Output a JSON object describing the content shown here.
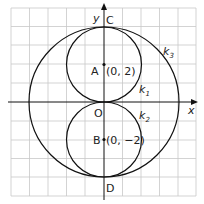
{
  "diagram": {
    "axes": {
      "x_label": "x",
      "y_label": "y"
    },
    "grid": {
      "color": "#c8c8c8",
      "cell_units": 1,
      "x_range": [
        -5,
        5
      ],
      "y_range": [
        -5,
        5
      ]
    },
    "points": [
      {
        "name": "C",
        "coords": [
          0,
          4
        ]
      },
      {
        "name": "A",
        "coords": [
          0,
          2
        ],
        "label": "(0, 2)"
      },
      {
        "name": "O",
        "coords": [
          0,
          0
        ]
      },
      {
        "name": "B",
        "coords": [
          0,
          -2
        ],
        "label": "(0, −2)"
      },
      {
        "name": "D",
        "coords": [
          0,
          -4
        ]
      }
    ],
    "circles": [
      {
        "name": "k1",
        "center": [
          0,
          2
        ],
        "radius": 2
      },
      {
        "name": "k2",
        "center": [
          0,
          -2
        ],
        "radius": 2
      },
      {
        "name": "k3",
        "center": [
          0,
          0
        ],
        "radius": 4
      }
    ],
    "labels": {
      "C": "C",
      "A": "A",
      "A_coord": "(0, 2)",
      "O": "O",
      "B": "B",
      "B_coord": "(0, −2)",
      "D": "D",
      "k": "k",
      "k1_sub": "1",
      "k2_sub": "2",
      "k3_sub": "3"
    }
  }
}
